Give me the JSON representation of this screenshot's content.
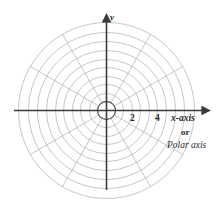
{
  "figure": {
    "name": "polar-coordinate-grid",
    "background_color": "#ffffff",
    "width": 221,
    "height": 215
  },
  "colors": {
    "grid": "#b3b3bb",
    "grid_inner_ring": "#55555f",
    "axis": "#3a3a3a",
    "text": "#2b2b2b"
  },
  "axes": {
    "origin": {
      "x": 106,
      "y": 110
    },
    "x_axis": {
      "label": "x-axis",
      "alt_label_connector": "or",
      "alt_label": "Polar axis",
      "start_x": 14,
      "end_x": 207,
      "arrow": "right"
    },
    "y_axis": {
      "label": "y",
      "start_y": 190,
      "end_y": 16,
      "arrow": "up"
    },
    "tick_labels": [
      {
        "text": "2",
        "value": 2,
        "x": 133
      },
      {
        "text": "4",
        "value": 4,
        "x": 158
      }
    ]
  },
  "chart_data": {
    "type": "polar-grid",
    "title": "",
    "subtitle": "",
    "xlabel": "x-axis",
    "ylabel": "y",
    "alt_xlabel": "Polar axis",
    "grid": true,
    "legend": "none",
    "radial_rings": {
      "count": 10,
      "radii_px": [
        9,
        17,
        26,
        34,
        43,
        51,
        60,
        69,
        78,
        88
      ],
      "r_values": [
        0.5,
        1,
        1.5,
        2,
        2.5,
        3,
        3.5,
        4,
        4.5,
        5
      ],
      "max_r": 5,
      "labeled_r": [
        2,
        4
      ]
    },
    "angular_spokes": {
      "count": 12,
      "step_degrees": 30,
      "angles_degrees": [
        0,
        30,
        60,
        90,
        120,
        150,
        180,
        210,
        240,
        270,
        300,
        330
      ]
    },
    "xlim": [
      -5,
      5
    ],
    "ylim": [
      -5,
      5
    ],
    "tick_labels": [
      "2",
      "4"
    ]
  }
}
